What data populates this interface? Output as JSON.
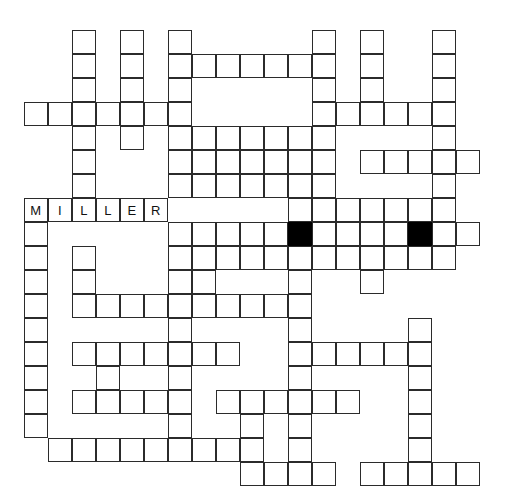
{
  "puzzle": {
    "kind": "crossword-grid",
    "title": "Crossword Puzzle Grid",
    "geometry": {
      "origin_x": 24,
      "origin_y": 30,
      "cell_size": 24,
      "columns": 19,
      "rows": 19
    },
    "colors": {
      "background": "#ffffff",
      "cell_fill": "#ffffff",
      "cell_border": "#2b2b2b",
      "block_fill": "#000000",
      "letter": "#111111"
    },
    "filled_answer": "MILLER",
    "cells": [
      {
        "r": 0,
        "c": 2
      },
      {
        "r": 0,
        "c": 4
      },
      {
        "r": 0,
        "c": 6
      },
      {
        "r": 0,
        "c": 12
      },
      {
        "r": 0,
        "c": 14
      },
      {
        "r": 0,
        "c": 17
      },
      {
        "r": 1,
        "c": 2
      },
      {
        "r": 1,
        "c": 4
      },
      {
        "r": 1,
        "c": 6
      },
      {
        "r": 1,
        "c": 7
      },
      {
        "r": 1,
        "c": 8
      },
      {
        "r": 1,
        "c": 9
      },
      {
        "r": 1,
        "c": 10
      },
      {
        "r": 1,
        "c": 11
      },
      {
        "r": 1,
        "c": 12
      },
      {
        "r": 1,
        "c": 14
      },
      {
        "r": 1,
        "c": 17
      },
      {
        "r": 2,
        "c": 2
      },
      {
        "r": 2,
        "c": 4
      },
      {
        "r": 2,
        "c": 6
      },
      {
        "r": 2,
        "c": 12
      },
      {
        "r": 2,
        "c": 14
      },
      {
        "r": 2,
        "c": 17
      },
      {
        "r": 3,
        "c": 0
      },
      {
        "r": 3,
        "c": 1
      },
      {
        "r": 3,
        "c": 2
      },
      {
        "r": 3,
        "c": 3
      },
      {
        "r": 3,
        "c": 4
      },
      {
        "r": 3,
        "c": 5
      },
      {
        "r": 3,
        "c": 6
      },
      {
        "r": 3,
        "c": 12
      },
      {
        "r": 3,
        "c": 13
      },
      {
        "r": 3,
        "c": 14
      },
      {
        "r": 3,
        "c": 15
      },
      {
        "r": 3,
        "c": 16
      },
      {
        "r": 3,
        "c": 17
      },
      {
        "r": 4,
        "c": 2
      },
      {
        "r": 4,
        "c": 4
      },
      {
        "r": 4,
        "c": 6
      },
      {
        "r": 4,
        "c": 7
      },
      {
        "r": 4,
        "c": 8
      },
      {
        "r": 4,
        "c": 9
      },
      {
        "r": 4,
        "c": 10
      },
      {
        "r": 4,
        "c": 11
      },
      {
        "r": 4,
        "c": 12
      },
      {
        "r": 4,
        "c": 17
      },
      {
        "r": 5,
        "c": 2
      },
      {
        "r": 5,
        "c": 6
      },
      {
        "r": 5,
        "c": 7
      },
      {
        "r": 5,
        "c": 8
      },
      {
        "r": 5,
        "c": 9
      },
      {
        "r": 5,
        "c": 10
      },
      {
        "r": 5,
        "c": 11
      },
      {
        "r": 5,
        "c": 12
      },
      {
        "r": 5,
        "c": 14
      },
      {
        "r": 5,
        "c": 15
      },
      {
        "r": 5,
        "c": 16
      },
      {
        "r": 5,
        "c": 17
      },
      {
        "r": 5,
        "c": 18
      },
      {
        "r": 6,
        "c": 2
      },
      {
        "r": 6,
        "c": 6
      },
      {
        "r": 6,
        "c": 7
      },
      {
        "r": 6,
        "c": 8
      },
      {
        "r": 6,
        "c": 9
      },
      {
        "r": 6,
        "c": 10
      },
      {
        "r": 6,
        "c": 11
      },
      {
        "r": 6,
        "c": 12
      },
      {
        "r": 6,
        "c": 17
      },
      {
        "r": 7,
        "c": 0,
        "letter": "M"
      },
      {
        "r": 7,
        "c": 1,
        "letter": "I"
      },
      {
        "r": 7,
        "c": 2,
        "letter": "L"
      },
      {
        "r": 7,
        "c": 3,
        "letter": "L"
      },
      {
        "r": 7,
        "c": 4,
        "letter": "E"
      },
      {
        "r": 7,
        "c": 5,
        "letter": "R"
      },
      {
        "r": 7,
        "c": 11
      },
      {
        "r": 7,
        "c": 12
      },
      {
        "r": 7,
        "c": 13
      },
      {
        "r": 7,
        "c": 14
      },
      {
        "r": 7,
        "c": 15
      },
      {
        "r": 7,
        "c": 16
      },
      {
        "r": 7,
        "c": 17
      },
      {
        "r": 8,
        "c": 0
      },
      {
        "r": 8,
        "c": 6
      },
      {
        "r": 8,
        "c": 7
      },
      {
        "r": 8,
        "c": 8
      },
      {
        "r": 8,
        "c": 9
      },
      {
        "r": 8,
        "c": 10
      },
      {
        "r": 8,
        "c": 11,
        "block": true
      },
      {
        "r": 8,
        "c": 12
      },
      {
        "r": 8,
        "c": 13
      },
      {
        "r": 8,
        "c": 14
      },
      {
        "r": 8,
        "c": 15
      },
      {
        "r": 8,
        "c": 16,
        "block": true
      },
      {
        "r": 8,
        "c": 17
      },
      {
        "r": 8,
        "c": 18
      },
      {
        "r": 9,
        "c": 0
      },
      {
        "r": 9,
        "c": 2
      },
      {
        "r": 9,
        "c": 6
      },
      {
        "r": 9,
        "c": 7
      },
      {
        "r": 9,
        "c": 8
      },
      {
        "r": 9,
        "c": 9
      },
      {
        "r": 9,
        "c": 10
      },
      {
        "r": 9,
        "c": 11
      },
      {
        "r": 9,
        "c": 12
      },
      {
        "r": 9,
        "c": 13
      },
      {
        "r": 9,
        "c": 14
      },
      {
        "r": 9,
        "c": 15
      },
      {
        "r": 9,
        "c": 16
      },
      {
        "r": 9,
        "c": 17
      },
      {
        "r": 10,
        "c": 0
      },
      {
        "r": 10,
        "c": 2
      },
      {
        "r": 10,
        "c": 6
      },
      {
        "r": 10,
        "c": 7
      },
      {
        "r": 10,
        "c": 11
      },
      {
        "r": 10,
        "c": 14
      },
      {
        "r": 11,
        "c": 0
      },
      {
        "r": 11,
        "c": 2
      },
      {
        "r": 11,
        "c": 3
      },
      {
        "r": 11,
        "c": 4
      },
      {
        "r": 11,
        "c": 5
      },
      {
        "r": 11,
        "c": 6
      },
      {
        "r": 11,
        "c": 7
      },
      {
        "r": 11,
        "c": 8
      },
      {
        "r": 11,
        "c": 9
      },
      {
        "r": 11,
        "c": 10
      },
      {
        "r": 11,
        "c": 11
      },
      {
        "r": 12,
        "c": 0
      },
      {
        "r": 12,
        "c": 6
      },
      {
        "r": 12,
        "c": 11
      },
      {
        "r": 12,
        "c": 16
      },
      {
        "r": 13,
        "c": 0
      },
      {
        "r": 13,
        "c": 2
      },
      {
        "r": 13,
        "c": 3
      },
      {
        "r": 13,
        "c": 4
      },
      {
        "r": 13,
        "c": 5
      },
      {
        "r": 13,
        "c": 6
      },
      {
        "r": 13,
        "c": 7
      },
      {
        "r": 13,
        "c": 8
      },
      {
        "r": 13,
        "c": 11
      },
      {
        "r": 13,
        "c": 12
      },
      {
        "r": 13,
        "c": 13
      },
      {
        "r": 13,
        "c": 14
      },
      {
        "r": 13,
        "c": 15
      },
      {
        "r": 13,
        "c": 16
      },
      {
        "r": 14,
        "c": 0
      },
      {
        "r": 14,
        "c": 3
      },
      {
        "r": 14,
        "c": 6
      },
      {
        "r": 14,
        "c": 11
      },
      {
        "r": 14,
        "c": 16
      },
      {
        "r": 15,
        "c": 0
      },
      {
        "r": 15,
        "c": 2
      },
      {
        "r": 15,
        "c": 3
      },
      {
        "r": 15,
        "c": 4
      },
      {
        "r": 15,
        "c": 5
      },
      {
        "r": 15,
        "c": 6
      },
      {
        "r": 15,
        "c": 8
      },
      {
        "r": 15,
        "c": 9
      },
      {
        "r": 15,
        "c": 10
      },
      {
        "r": 15,
        "c": 11
      },
      {
        "r": 15,
        "c": 12
      },
      {
        "r": 15,
        "c": 13
      },
      {
        "r": 15,
        "c": 16
      },
      {
        "r": 16,
        "c": 0
      },
      {
        "r": 16,
        "c": 6
      },
      {
        "r": 16,
        "c": 9
      },
      {
        "r": 16,
        "c": 11
      },
      {
        "r": 16,
        "c": 16
      },
      {
        "r": 17,
        "c": 1
      },
      {
        "r": 17,
        "c": 2
      },
      {
        "r": 17,
        "c": 3
      },
      {
        "r": 17,
        "c": 4
      },
      {
        "r": 17,
        "c": 5
      },
      {
        "r": 17,
        "c": 6
      },
      {
        "r": 17,
        "c": 7
      },
      {
        "r": 17,
        "c": 8
      },
      {
        "r": 17,
        "c": 9
      },
      {
        "r": 17,
        "c": 11
      },
      {
        "r": 17,
        "c": 16
      },
      {
        "r": 18,
        "c": 9
      },
      {
        "r": 18,
        "c": 10
      },
      {
        "r": 18,
        "c": 11
      },
      {
        "r": 18,
        "c": 12
      },
      {
        "r": 18,
        "c": 14
      },
      {
        "r": 18,
        "c": 15
      },
      {
        "r": 18,
        "c": 16
      },
      {
        "r": 18,
        "c": 17
      },
      {
        "r": 18,
        "c": 18
      }
    ]
  }
}
